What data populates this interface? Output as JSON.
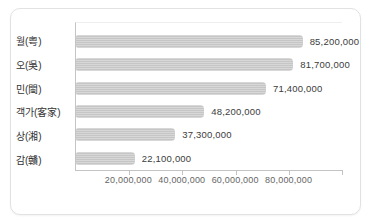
{
  "chart_data": {
    "type": "bar",
    "orientation": "horizontal",
    "title": "",
    "xlabel": "",
    "ylabel": "",
    "categories": [
      "월(粤)",
      "오(吳)",
      "민(閩)",
      "객가(客家)",
      "상(湘)",
      "감(贛)"
    ],
    "values": [
      85200000,
      81700000,
      71400000,
      48200000,
      37300000,
      22100000
    ],
    "value_labels": [
      "85,200,000",
      "81,700,000",
      "71,400,000",
      "48,200,000",
      "37,300,000",
      "22,100,000"
    ],
    "xlim": [
      0,
      100000000
    ],
    "x_tick_values": [
      20000000,
      40000000,
      60000000,
      80000000
    ],
    "x_tick_labels": [
      "20,000,000",
      "40,000,000",
      "60,000,000",
      "80,000,000"
    ],
    "axis_tick_marks": [
      20000000,
      40000000,
      60000000,
      80000000,
      100000000
    ],
    "grid": false,
    "legend": false,
    "bar_color": "#c9c9c9",
    "axis_color": "#c4c4c4",
    "label_color": "#333333",
    "tick_label_color": "#666666",
    "card_border_color": "#e2e2e2",
    "background_color": "#ffffff"
  }
}
